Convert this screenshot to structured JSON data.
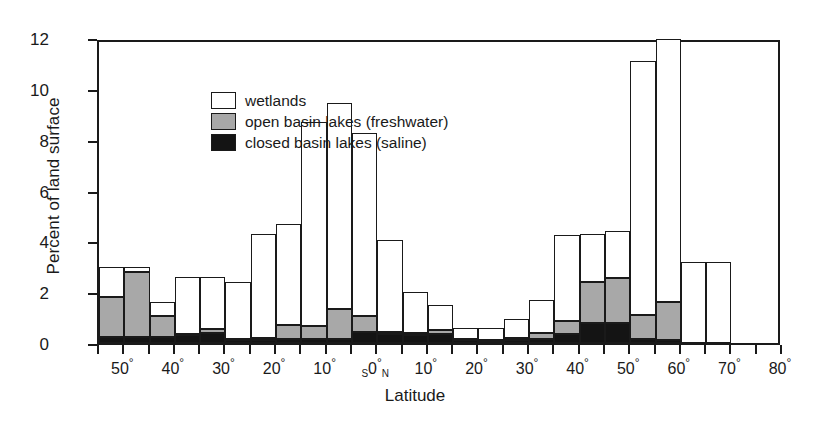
{
  "chart_data": {
    "type": "bar",
    "stacked": true,
    "title": "",
    "xlabel": "Latitude",
    "ylabel": "Percent of land surface",
    "ylim": [
      0,
      12
    ],
    "yticks": [
      0,
      2,
      4,
      6,
      8,
      10,
      12
    ],
    "grid": false,
    "legend_position": "top-left",
    "xtick_labels": [
      "50°",
      "40°",
      "30°",
      "20°",
      "10°",
      "0°",
      "10°",
      "20°",
      "30°",
      "40°",
      "50°",
      "60°",
      "70°",
      "80°"
    ],
    "hemisphere_markers": {
      "south": "S",
      "north": "N"
    },
    "categories": [
      "55-50S",
      "50-45S",
      "45-40S",
      "40-35S",
      "35-30S",
      "30-25S",
      "25-20S",
      "20-15S",
      "15-10S",
      "10-5S",
      "5-0S",
      "0-5N",
      "5-10N",
      "10-15N",
      "15-20N",
      "20-25N",
      "25-30N",
      "30-35N",
      "35-40N",
      "40-45N",
      "45-50N",
      "50-55N",
      "55-60N",
      "60-65N",
      "65-70N",
      "70-75N",
      "75-80N"
    ],
    "series": [
      {
        "name": "closed basin lakes (saline)",
        "color": "#141414",
        "values": [
          0.25,
          0.25,
          0.25,
          0.3,
          0.4,
          0.1,
          0.1,
          0.15,
          0.15,
          0.15,
          0.45,
          0.35,
          0.3,
          0.35,
          0.1,
          0.05,
          0.1,
          0.15,
          0.35,
          0.8,
          0.8,
          0.15,
          0.1,
          0,
          0,
          0,
          0
        ]
      },
      {
        "name": "open basin lakes (freshwater)",
        "color": "#a8a8a8",
        "values": [
          1.55,
          2.55,
          0.8,
          0.05,
          0.15,
          0.05,
          0.1,
          0.55,
          0.5,
          1.2,
          0.6,
          0.1,
          0.1,
          0.15,
          0.05,
          0.05,
          0.1,
          0.25,
          0.5,
          1.6,
          1.75,
          0.95,
          1.5,
          0,
          0,
          0,
          0
        ]
      },
      {
        "name": "wetlands",
        "color": "#ffffff",
        "values": [
          1.2,
          0.2,
          0.55,
          2.25,
          2.05,
          2.25,
          4.1,
          4.0,
          8.05,
          8.1,
          7.2,
          3.6,
          1.6,
          1.0,
          0.45,
          0.5,
          0.75,
          1.3,
          3.4,
          1.9,
          1.85,
          10.0,
          10.35,
          3.2,
          3.2,
          0,
          0
        ]
      }
    ],
    "totals": [
      3.0,
      3.0,
      1.6,
      2.6,
      2.6,
      2.4,
      4.3,
      4.7,
      8.7,
      9.45,
      8.25,
      4.05,
      2.0,
      1.5,
      0.6,
      0.6,
      0.95,
      1.7,
      4.25,
      4.3,
      4.4,
      11.1,
      11.95,
      3.2,
      3.2,
      0,
      0
    ]
  },
  "legend": {
    "items": [
      {
        "swatch": "wet",
        "label": "wetlands"
      },
      {
        "swatch": "open",
        "label": "open basin lakes (freshwater)"
      },
      {
        "swatch": "closed",
        "label": "closed basin lakes (saline)"
      }
    ]
  }
}
